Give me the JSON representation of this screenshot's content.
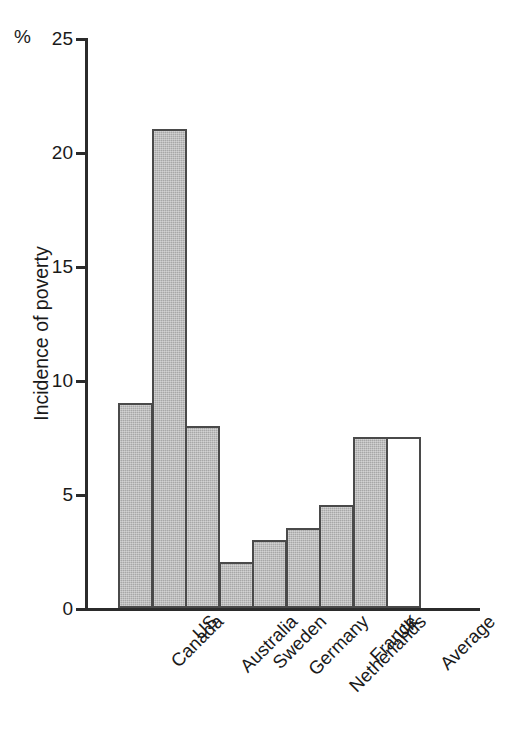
{
  "chart_data": {
    "type": "bar",
    "title": "",
    "subtitle": "",
    "xlabel": "",
    "ylabel": "Incidence of poverty",
    "unit_label": "%",
    "ylim": [
      0,
      25
    ],
    "yticks": [
      0,
      5,
      10,
      15,
      20,
      25
    ],
    "ytick_labels": [
      "0",
      "5",
      "10",
      "15",
      "20",
      "25"
    ],
    "grid": false,
    "legend": null,
    "categories": [
      "Canada",
      "US",
      "Australia",
      "Sweden",
      "Germany",
      "Netherlands",
      "France",
      "UK",
      "Average"
    ],
    "values": [
      9,
      21,
      8,
      2,
      3,
      3.5,
      4.5,
      7.5,
      7.5
    ],
    "bar_styles": [
      "filled",
      "filled",
      "filled",
      "filled",
      "filled",
      "filled",
      "filled",
      "filled",
      "hollow"
    ],
    "colors": {
      "bar_fill": "#a7a7a7",
      "bar_fill_hollow": "#ffffff",
      "bar_outline": "#4a4a4a",
      "axis": "#2b2b2b",
      "text": "#1a1a1a",
      "background": "#ffffff"
    }
  }
}
